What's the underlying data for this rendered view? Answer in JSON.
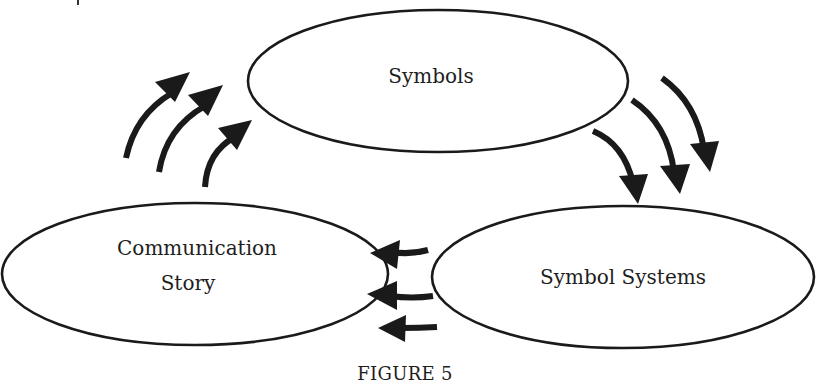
{
  "diagram": {
    "nodes": [
      {
        "id": "symbols",
        "label": "Symbols"
      },
      {
        "id": "communication-story",
        "label_lines": [
          "Communication",
          "Story"
        ]
      },
      {
        "id": "symbol-systems",
        "label": "Symbol Systems"
      }
    ],
    "edges": [
      {
        "from": "communication-story",
        "to": "symbols",
        "count": 3,
        "style": "curved-arrow"
      },
      {
        "from": "symbols",
        "to": "symbol-systems",
        "count": 3,
        "style": "curved-arrow"
      },
      {
        "from": "symbol-systems",
        "to": "communication-story",
        "count": 3,
        "style": "curved-arrow"
      }
    ],
    "colors": {
      "stroke": "#1a1a1a",
      "text": "#1e1e1e",
      "background": "#ffffff"
    }
  },
  "caption": "FIGURE 5"
}
